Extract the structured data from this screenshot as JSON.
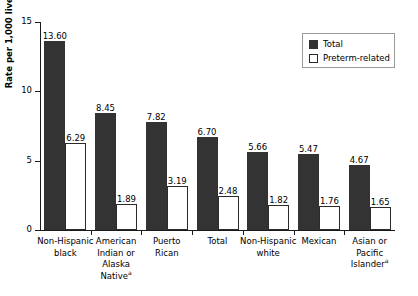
{
  "chart_data": {
    "type": "bar",
    "title": "",
    "xlabel": "",
    "ylabel": "Rate per 1,000 live births",
    "ylim": [
      0,
      15
    ],
    "yticks": [
      "0",
      "5",
      "10",
      "15"
    ],
    "ytick_values": [
      0,
      5,
      10,
      15
    ],
    "grid": false,
    "legend_position": "top-right",
    "categories": [
      "Non-Hispanic black",
      "American Indian or Alaska Native",
      "Puerto Rican",
      "Total",
      "Non-Hispanic white",
      "Mexican",
      "Asian or Pacific Islander"
    ],
    "category_lines": [
      [
        "Non-Hispanic",
        "black"
      ],
      [
        "American",
        "Indian or",
        "Alaska",
        "Native"
      ],
      [
        "Puerto",
        "Rican"
      ],
      [
        "Total"
      ],
      [
        "Non-Hispanic",
        "white"
      ],
      [
        "Mexican"
      ],
      [
        "Asian or",
        "Pacific",
        "Islander"
      ]
    ],
    "category_footnotes": [
      "",
      "a",
      "",
      "",
      "",
      "",
      "a"
    ],
    "series": [
      {
        "name": "Total",
        "color": "#333333",
        "values": [
          13.6,
          8.45,
          7.82,
          6.7,
          5.66,
          5.47,
          4.67
        ],
        "labels": [
          "13.60",
          "8.45",
          "7.82",
          "6.70",
          "5.66",
          "5.47",
          "4.67"
        ]
      },
      {
        "name": "Preterm-related",
        "color": "#ffffff",
        "values": [
          6.29,
          1.89,
          3.19,
          2.48,
          1.82,
          1.76,
          1.65
        ],
        "labels": [
          "6.29",
          "1.89",
          "3.19",
          "2.48",
          "1.82",
          "1.76",
          "1.65"
        ]
      }
    ]
  },
  "legend": {
    "items": [
      {
        "label": "Total",
        "swatch": "filled-dark-square"
      },
      {
        "label": "Preterm-related",
        "swatch": "outlined-white-square"
      }
    ]
  },
  "colors": {
    "total_bar": "#333333",
    "preterm_bar": "#ffffff",
    "bar_outline": "#2b2b2b",
    "axis": "#1a1a1a",
    "text": "#000000",
    "background": "#ffffff"
  }
}
